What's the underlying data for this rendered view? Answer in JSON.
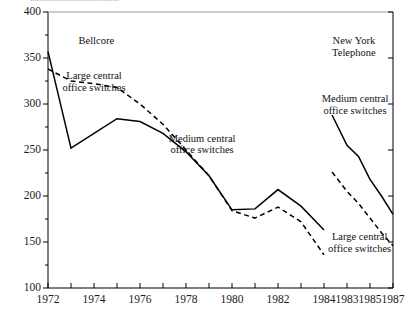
{
  "figure": {
    "clipped_top_text": "........................................",
    "background_color": "#ffffff",
    "line_color": "#000000"
  },
  "chart_data": {
    "type": "line",
    "title": "",
    "subtitle": "",
    "xlabel": "",
    "ylabel": "",
    "xlim": [
      1972,
      1987
    ],
    "ylim": [
      100,
      400
    ],
    "grid": false,
    "legend": "annotations-in-plot",
    "y_ticks": [
      100,
      150,
      200,
      250,
      300,
      350,
      400
    ],
    "y_tick_labels": [
      "100",
      "150",
      "200",
      "250",
      "300",
      "350",
      "400"
    ],
    "y_minor_ticks": [
      125,
      175,
      225,
      275,
      325,
      375
    ],
    "x_ticks": [
      1972,
      1973,
      1974,
      1975,
      1976,
      1977,
      1978,
      1979,
      1980,
      1981,
      1982,
      1983,
      1984,
      1985,
      1986,
      1987
    ],
    "x_tick_labels": [
      {
        "x": 1972,
        "label": "1972"
      },
      {
        "x": 1974,
        "label": "1974"
      },
      {
        "x": 1976,
        "label": "1976"
      },
      {
        "x": 1978,
        "label": "1978"
      },
      {
        "x": 1980,
        "label": "1980"
      },
      {
        "x": 1982,
        "label": "1982"
      },
      {
        "x": 1984,
        "label": "1984"
      },
      {
        "x": 1985,
        "label": "1983"
      },
      {
        "x": 1986,
        "label": "1985"
      },
      {
        "x": 1987,
        "label": "1987"
      }
    ],
    "groups": [
      {
        "name": "Bellcore",
        "label_x": 1974.1,
        "label_y": 368,
        "series": [
          {
            "name": "Medium central office switches",
            "style": "solid",
            "x": [
              1972,
              1973,
              1974,
              1975,
              1976,
              1977,
              1978,
              1979,
              1980,
              1981,
              1982,
              1983,
              1984
            ],
            "values": [
              357,
              252,
              268,
              284,
              281,
              268,
              248,
              222,
              185,
              186,
              207,
              189,
              163
            ]
          },
          {
            "name": "Large central office switches",
            "style": "dashed",
            "x": [
              1972,
              1973,
              1974,
              1975,
              1976,
              1977,
              1978,
              1979,
              1980,
              1981,
              1982,
              1983,
              1984
            ],
            "values": [
              338,
              325,
              322,
              318,
              300,
              278,
              250,
              222,
              184,
              176,
              188,
              172,
              136
            ]
          }
        ],
        "annotations": [
          {
            "text_lines": [
              "Large central",
              "office switches"
            ],
            "x": 1974.0,
            "y": 330
          },
          {
            "text_lines": [
              "Medium central",
              "office switches"
            ],
            "x": 1978.7,
            "y": 262
          }
        ]
      },
      {
        "name": "New York Telephone",
        "label_x": 1985.3,
        "label_y": 368,
        "series": [
          {
            "name": "Medium central office switches",
            "style": "solid",
            "x": [
              1984.35,
              1985,
              1985.5,
              1986,
              1986.5,
              1987
            ],
            "values": [
              288,
              255,
              243,
              218,
              200,
              180
            ]
          },
          {
            "name": "Large central office switches",
            "style": "dashed",
            "x": [
              1984.35,
              1985,
              1985.5,
              1986,
              1986.5,
              1987
            ],
            "values": [
              226,
              205,
              192,
              176,
              160,
              146
            ]
          }
        ],
        "annotations": [
          {
            "text_lines": [
              "Medium central",
              "office switches"
            ],
            "x": 1985.35,
            "y": 305
          },
          {
            "text_lines": [
              "Large central",
              "office switches"
            ],
            "x": 1985.55,
            "y": 155
          }
        ]
      }
    ]
  }
}
